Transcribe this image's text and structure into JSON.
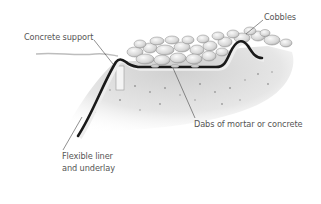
{
  "diagram": {
    "labels": {
      "concrete_support": "Concrete support",
      "cobbles": "Cobbles",
      "dabs": "Dabs of mortar or concrete",
      "liner_line1": "Flexible liner",
      "liner_line2": "and underlay"
    },
    "elements": [
      "ground-surface",
      "cobbles",
      "concrete-support",
      "flexible-liner",
      "mortar-dabs",
      "soil"
    ],
    "colors": {
      "liner": "#1a1a1a",
      "underlay": "#e8e8e8",
      "soil": "#d8d8d8",
      "cobble": "#e2e2e2",
      "text": "#555555",
      "leader": "#444444"
    }
  }
}
